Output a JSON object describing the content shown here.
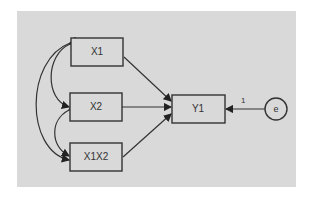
{
  "diagram": {
    "type": "path diagram (SEM)",
    "nodes": [
      {
        "id": "X1",
        "label": "X1",
        "shape": "rect"
      },
      {
        "id": "X2",
        "label": "X2",
        "shape": "rect"
      },
      {
        "id": "X1X2",
        "label": "X1X2",
        "shape": "rect"
      },
      {
        "id": "Y1",
        "label": "Y1",
        "shape": "rect"
      },
      {
        "id": "e",
        "label": "e",
        "shape": "circle"
      }
    ],
    "edges": [
      {
        "from": "X1",
        "to": "Y1",
        "type": "directed"
      },
      {
        "from": "X2",
        "to": "Y1",
        "type": "directed"
      },
      {
        "from": "X1X2",
        "to": "Y1",
        "type": "directed"
      },
      {
        "from": "e",
        "to": "Y1",
        "type": "directed",
        "label": "1"
      },
      {
        "from": "X1",
        "to": "X2",
        "type": "covariance"
      },
      {
        "from": "X2",
        "to": "X1X2",
        "type": "covariance"
      },
      {
        "from": "X1",
        "to": "X1X2",
        "type": "covariance"
      }
    ],
    "colors": {
      "background": "#d9d9d9",
      "stroke": "#333333"
    }
  }
}
